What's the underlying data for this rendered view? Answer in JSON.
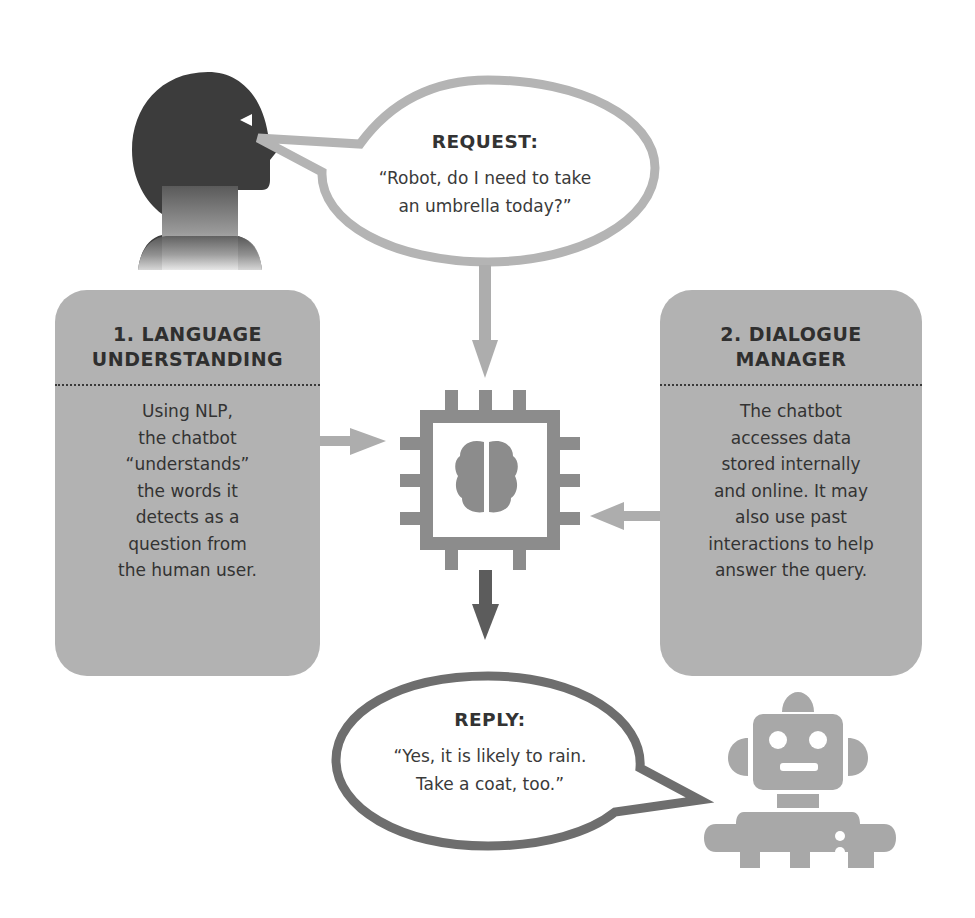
{
  "diagram": {
    "request": {
      "label": "REQUEST:",
      "text": "“Robot, do I need to take\nan umbrella today?”"
    },
    "reply": {
      "label": "REPLY:",
      "text": "“Yes, it is likely to rain.\nTake a coat, too.”"
    },
    "steps": [
      {
        "title": "1. LANGUAGE\nUNDERSTANDING",
        "title_line1": "1. LANGUAGE",
        "title_line2": "UNDERSTANDING",
        "body": "Using NLP,\nthe chatbot\n“understands”\nthe words it\ndetects as a\nquestion from\nthe human user."
      },
      {
        "title": "2. DIALOGUE\nMANAGER",
        "title_line1": "2. DIALOGUE",
        "title_line2": "MANAGER",
        "body": "The chatbot\naccesses data\nstored internally\nand online. It may\nalso use past\ninteractions to help\nanswer the query."
      }
    ],
    "icons": {
      "human": "human-head-icon",
      "chip": "processor-chip-icon",
      "brain": "brain-icon",
      "robot": "robot-icon"
    },
    "colors": {
      "box_fill": "#b2b2b2",
      "request_outline": "#b4b4b4",
      "reply_outline": "#6e6e6e",
      "chip": "#8c8c8c",
      "head": "#3c3c3c",
      "robot": "#a8a8a8",
      "arrow_light": "#adadad",
      "arrow_dark": "#5c5c5c"
    }
  }
}
